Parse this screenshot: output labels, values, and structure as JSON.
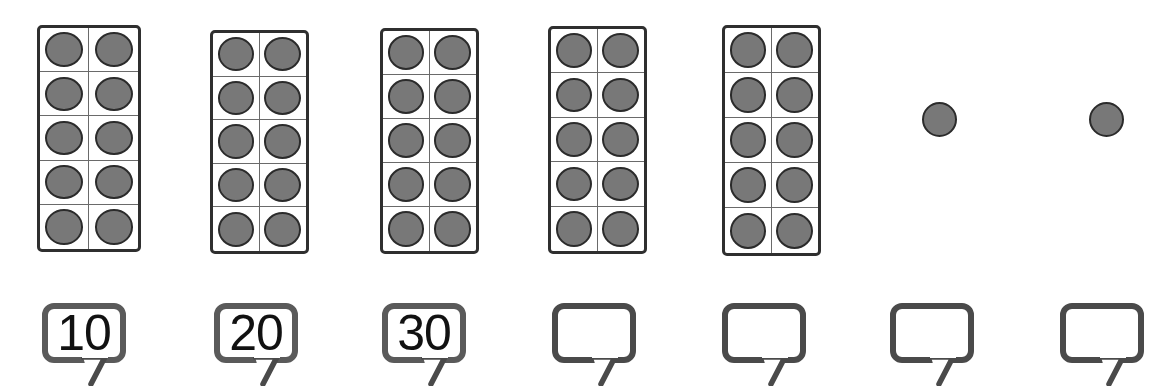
{
  "worksheet": {
    "title": "Counting by tens with ten-frames",
    "colors": {
      "dot_fill": "#787878",
      "dot_stroke": "#2b2b2b",
      "frame_stroke": "#2f2f2f",
      "grid_line": "#6a6a6a",
      "bubble_stroke": "#4a4a4a",
      "text": "#111111",
      "background": "#ffffff"
    }
  },
  "ten_frames": [
    {
      "id": "ten-frame-1",
      "dots": 10,
      "rows": 5,
      "cols": 2,
      "x": 37,
      "y": 25,
      "width": 104,
      "height": 227
    },
    {
      "id": "ten-frame-2",
      "dots": 10,
      "rows": 5,
      "cols": 2,
      "x": 210,
      "y": 30,
      "width": 99,
      "height": 224
    },
    {
      "id": "ten-frame-3",
      "dots": 10,
      "rows": 5,
      "cols": 2,
      "x": 380,
      "y": 28,
      "width": 99,
      "height": 226
    },
    {
      "id": "ten-frame-4",
      "dots": 10,
      "rows": 5,
      "cols": 2,
      "x": 548,
      "y": 26,
      "width": 99,
      "height": 228
    },
    {
      "id": "ten-frame-5",
      "dots": 10,
      "rows": 5,
      "cols": 2,
      "x": 722,
      "y": 25,
      "width": 99,
      "height": 231
    }
  ],
  "loose_dots": [
    {
      "id": "single-counter-1",
      "x": 922,
      "y": 102,
      "size": 35
    },
    {
      "id": "single-counter-2",
      "x": 1089,
      "y": 102,
      "size": 35
    }
  ],
  "answer_bubbles": [
    {
      "id": "bubble-1",
      "value": "10",
      "filled": true,
      "x": 42,
      "y": 303,
      "width": 84,
      "height": 60
    },
    {
      "id": "bubble-2",
      "value": "20",
      "filled": true,
      "x": 214,
      "y": 303,
      "width": 84,
      "height": 60
    },
    {
      "id": "bubble-3",
      "value": "30",
      "filled": true,
      "x": 382,
      "y": 303,
      "width": 84,
      "height": 60
    },
    {
      "id": "bubble-4",
      "value": "",
      "filled": false,
      "x": 552,
      "y": 303,
      "width": 84,
      "height": 60
    },
    {
      "id": "bubble-5",
      "value": "",
      "filled": false,
      "x": 722,
      "y": 303,
      "width": 84,
      "height": 60
    },
    {
      "id": "bubble-6",
      "value": "",
      "filled": false,
      "x": 890,
      "y": 303,
      "width": 84,
      "height": 60
    },
    {
      "id": "bubble-7",
      "value": "",
      "filled": false,
      "x": 1060,
      "y": 303,
      "width": 84,
      "height": 60
    }
  ]
}
